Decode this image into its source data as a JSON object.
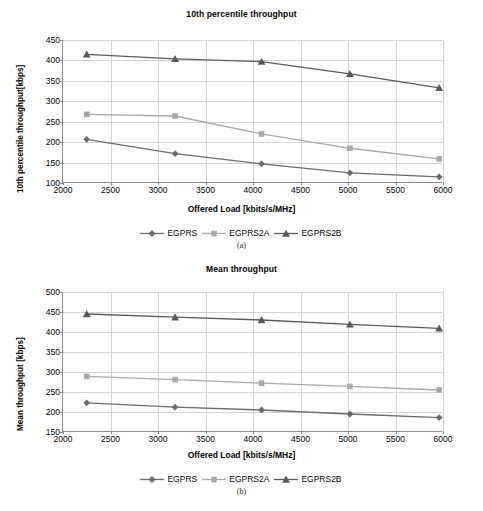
{
  "figure": {
    "panels": [
      {
        "id": "a",
        "caption": "(a)",
        "title": "10th percentile throughput",
        "xlabel": "Offered Load [kbits/s/MHz]",
        "ylabel": "10th percentile throughput[kbps]",
        "xticks": [
          "2000",
          "2500",
          "3000",
          "3500",
          "4000",
          "4500",
          "5000",
          "5500",
          "6000"
        ],
        "yticks": [
          "100",
          "150",
          "200",
          "250",
          "300",
          "350",
          "400",
          "450"
        ],
        "legend": [
          "EGPRS",
          "EGPRS2A",
          "EGPRS2B"
        ]
      },
      {
        "id": "b",
        "caption": "(b)",
        "title": "Mean throughput",
        "xlabel": "Offered Load [kbits/s/MHz]",
        "ylabel": "Mean throughput [kbps]",
        "xticks": [
          "2000",
          "2500",
          "3000",
          "3500",
          "4000",
          "4500",
          "5000",
          "5500",
          "6000"
        ],
        "yticks": [
          "150",
          "200",
          "250",
          "300",
          "350",
          "400",
          "450",
          "500"
        ],
        "legend": [
          "EGPRS",
          "EGPRS2A",
          "EGPRS2B"
        ]
      }
    ]
  },
  "colors": {
    "egprs": "#6b6b6b",
    "egprs2a": "#a8a8a8",
    "egprs2b": "#595959",
    "grid": "#d2d2d2",
    "axis": "#8a8a8a"
  },
  "chart_data": [
    {
      "type": "line",
      "panel": "a",
      "title": "10th percentile throughput",
      "xlabel": "Offered Load [kbits/s/MHz]",
      "ylabel": "10th percentile throughput[kbps]",
      "xlim": [
        2000,
        6000
      ],
      "ylim": [
        100,
        450
      ],
      "xticks": [
        2000,
        2500,
        3000,
        3500,
        4000,
        4500,
        5000,
        5500,
        6000
      ],
      "yticks": [
        100,
        150,
        200,
        250,
        300,
        350,
        400,
        450
      ],
      "grid": true,
      "legend_position": "below",
      "x": [
        2250,
        3180,
        4090,
        5020,
        5960
      ],
      "series": [
        {
          "name": "EGPRS",
          "marker": "diamond",
          "color": "#6b6b6b",
          "values": [
            207,
            172,
            147,
            125,
            115
          ]
        },
        {
          "name": "EGPRS2A",
          "marker": "square",
          "color": "#a8a8a8",
          "values": [
            268,
            264,
            220,
            185,
            159
          ]
        },
        {
          "name": "EGPRS2B",
          "marker": "triangle",
          "color": "#595959",
          "values": [
            415,
            404,
            397,
            367,
            333
          ]
        }
      ]
    },
    {
      "type": "line",
      "panel": "b",
      "title": "Mean throughput",
      "xlabel": "Offered Load [kbits/s/MHz]",
      "ylabel": "Mean throughput [kbps]",
      "xlim": [
        2000,
        6000
      ],
      "ylim": [
        150,
        500
      ],
      "xticks": [
        2000,
        2500,
        3000,
        3500,
        4000,
        4500,
        5000,
        5500,
        6000
      ],
      "yticks": [
        150,
        200,
        250,
        300,
        350,
        400,
        450,
        500
      ],
      "grid": true,
      "legend_position": "below",
      "x": [
        2250,
        3180,
        4090,
        5020,
        5960
      ],
      "series": [
        {
          "name": "EGPRS",
          "marker": "diamond",
          "color": "#6b6b6b",
          "values": [
            223,
            212,
            205,
            195,
            186
          ]
        },
        {
          "name": "EGPRS2A",
          "marker": "square",
          "color": "#a8a8a8",
          "values": [
            289,
            281,
            272,
            264,
            255
          ]
        },
        {
          "name": "EGPRS2B",
          "marker": "triangle",
          "color": "#595959",
          "values": [
            445,
            437,
            430,
            419,
            409
          ]
        }
      ]
    }
  ]
}
